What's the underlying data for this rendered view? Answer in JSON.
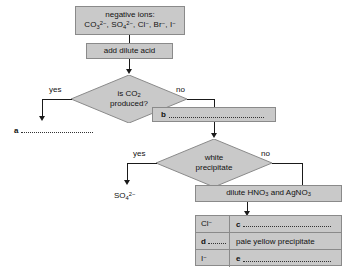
{
  "diagram": {
    "type": "flowchart",
    "nodes": {
      "start": {
        "line1": "negative ions:",
        "ions": [
          "CO3 2-",
          "SO4 2-",
          "Cl -",
          "Br -",
          "I -"
        ]
      },
      "add_acid": {
        "label": "add dilute acid"
      },
      "decision_co2": {
        "line1": "is CO",
        "sub": "2",
        "line2": "produced?"
      },
      "answer_a": {
        "letter": "a",
        "value": ""
      },
      "answer_b": {
        "letter": "b",
        "value": ""
      },
      "decision_white": {
        "line1": "white",
        "line2": "precipitate"
      },
      "sulfate": {
        "label": "SO4 2-"
      },
      "reagents": {
        "label": "dilute HNO3 and AgNO3"
      }
    },
    "edges": {
      "yes": "yes",
      "no": "no",
      "yes2": "yes",
      "no2": "no"
    },
    "table": {
      "rows": [
        {
          "ion": "Cl -",
          "ion_letter": "",
          "observation_letter": "c",
          "observation": ""
        },
        {
          "ion": "",
          "ion_letter": "d",
          "observation_letter": "",
          "observation": "pale yellow precipitate"
        },
        {
          "ion": "I -",
          "ion_letter": "",
          "observation_letter": "e",
          "observation": ""
        }
      ]
    },
    "colors": {
      "node_fill": "#c9c9c9",
      "node_border": "#8a8a8a",
      "line": "#1a1a1a",
      "text": "#111111",
      "background": "#ffffff"
    }
  }
}
